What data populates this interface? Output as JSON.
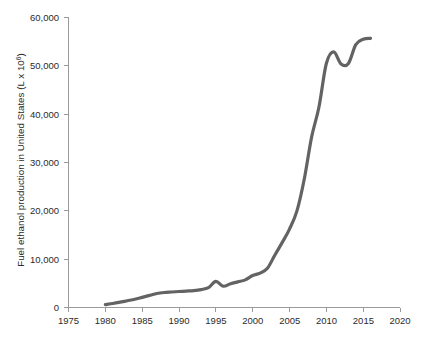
{
  "chart_data": {
    "type": "line",
    "title": "",
    "xlabel": "",
    "ylabel": "Fuel ethanol production in United States (L x 10⁶)",
    "ylabel_text": "Fuel ethanol production in United States (L x 10",
    "ylabel_exponent": "6",
    "ylabel_suffix": ")",
    "xlim": [
      1975,
      2020
    ],
    "ylim": [
      0,
      60000
    ],
    "grid": false,
    "legend": "none",
    "line_color": "#636363",
    "axis_color": "#9a9a9a",
    "text_color": "#2b2b2b",
    "xticks": [
      1975,
      1980,
      1985,
      1990,
      1995,
      2000,
      2005,
      2010,
      2015,
      2020
    ],
    "xtick_labels": [
      "1975",
      "1980",
      "1985",
      "1990",
      "1995",
      "2000",
      "2005",
      "2010",
      "2015",
      "2020"
    ],
    "yticks": [
      0,
      10000,
      20000,
      30000,
      40000,
      50000,
      60000
    ],
    "ytick_labels": [
      "0",
      "10,000",
      "20,000",
      "30,000",
      "40,000",
      "50,000",
      "60,000"
    ],
    "x": [
      1980,
      1981,
      1982,
      1983,
      1984,
      1985,
      1986,
      1987,
      1988,
      1989,
      1990,
      1991,
      1992,
      1993,
      1994,
      1995,
      1996,
      1997,
      1998,
      1999,
      2000,
      2001,
      2002,
      2003,
      2004,
      2005,
      2006,
      2007,
      2008,
      2009,
      2010,
      2011,
      2012,
      2013,
      2014,
      2015,
      2016
    ],
    "values": [
      600,
      830,
      1100,
      1400,
      1700,
      2100,
      2500,
      2900,
      3100,
      3200,
      3300,
      3400,
      3500,
      3700,
      4100,
      5400,
      4400,
      4900,
      5300,
      5700,
      6600,
      7100,
      8100,
      10800,
      13400,
      16200,
      19900,
      26500,
      35200,
      41400,
      50400,
      52800,
      50300,
      50400,
      54300,
      55400,
      55600
    ]
  }
}
